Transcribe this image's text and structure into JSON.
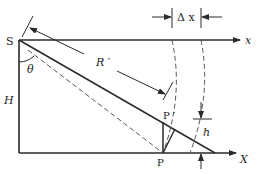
{
  "diagram": {
    "labels": {
      "source": "S",
      "angle": "θ",
      "slant_range": "R ′",
      "height": "H",
      "point": "P",
      "point_prime": "P ′",
      "elevation": "h",
      "ground_axis": "X",
      "top_axis": "x",
      "delta": "Δ x"
    },
    "colors": {
      "line": "#2a2a2a",
      "dashed": "#555555",
      "background": "#ffffff"
    }
  }
}
